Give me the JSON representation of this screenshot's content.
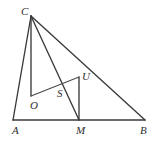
{
  "figure": {
    "type": "geometry-diagram",
    "width": 159,
    "height": 151,
    "background_color": "#ffffff",
    "stroke_color": "#3a3a3c",
    "label_color": "#2e2e30",
    "points": {
      "A": {
        "label": "A",
        "x": 13,
        "y": 120,
        "label_x": 12,
        "label_y": 125
      },
      "B": {
        "label": "B",
        "x": 145,
        "y": 120,
        "label_x": 140,
        "label_y": 125
      },
      "C": {
        "label": "C",
        "x": 31,
        "y": 16,
        "label_x": 21,
        "label_y": 6
      },
      "M": {
        "label": "M",
        "x": 79,
        "y": 120,
        "label_x": 76,
        "label_y": 125
      },
      "O": {
        "label": "O",
        "x": 31,
        "y": 96,
        "label_x": 30,
        "label_y": 100
      },
      "S": {
        "label": "S",
        "x": 60,
        "y": 86,
        "label_x": 57,
        "label_y": 88
      },
      "U": {
        "label": "U",
        "x": 79,
        "y": 77,
        "label_x": 82,
        "label_y": 71
      }
    },
    "segments": [
      {
        "name": "segment-AB",
        "from": "A",
        "to": "B"
      },
      {
        "name": "segment-AC",
        "from": "A",
        "to": "C"
      },
      {
        "name": "segment-CB",
        "from": "C",
        "to": "B"
      },
      {
        "name": "segment-CO",
        "from": "C",
        "to": "O"
      },
      {
        "name": "segment-CM",
        "from": "C",
        "to": "M"
      },
      {
        "name": "segment-OU",
        "from": "O",
        "to": "U"
      },
      {
        "name": "segment-UM",
        "from": "U",
        "to": "M"
      }
    ]
  }
}
